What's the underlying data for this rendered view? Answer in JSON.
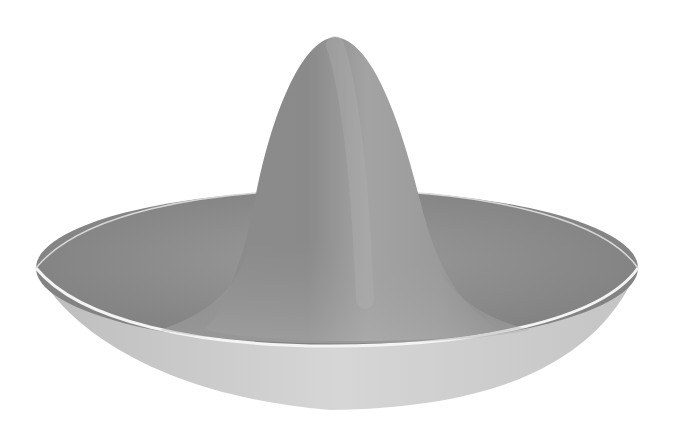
{
  "figure": {
    "colors": {
      "background": "#ffffff",
      "peak_light": "#a9a9a9",
      "peak_dark": "#7d7d7d",
      "brim_inner": "#8a8a8a",
      "brim_outer": "#d2d2d2",
      "rim_highlight": "#f4f4f4"
    }
  }
}
